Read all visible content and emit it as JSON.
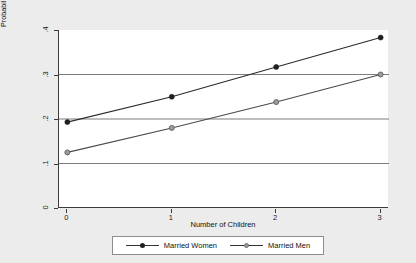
{
  "chart_data": {
    "type": "line",
    "title": "",
    "subtitle": "",
    "xlabel": "Number of Children",
    "ylabel": "Probability of No Articles",
    "x": [
      0,
      1,
      2,
      3
    ],
    "xticklabels": [
      "0",
      "1",
      "2",
      "3"
    ],
    "yticklabels": [
      "0",
      ".1",
      ".2",
      ".3",
      ".4"
    ],
    "yticks": [
      0,
      0.1,
      0.2,
      0.3,
      0.4
    ],
    "xlim": [
      -0.08,
      3.08
    ],
    "ylim": [
      0,
      0.4
    ],
    "grid": "horizontal",
    "gridlines": [
      0.1,
      0.2,
      0.3
    ],
    "legend_position": "bottom",
    "series": [
      {
        "name": "Married Women",
        "marker": "filled-circle",
        "color": "#2b2b2b",
        "values": [
          0.193,
          0.25,
          0.317,
          0.383
        ]
      },
      {
        "name": "Married Men",
        "marker": "open-circle",
        "color": "#4a4a4a",
        "values": [
          0.125,
          0.18,
          0.238,
          0.3
        ]
      }
    ]
  },
  "legend": {
    "entries": [
      {
        "label": "Married Women"
      },
      {
        "label": "Married Men"
      }
    ]
  },
  "colors": {
    "background": "#ececec",
    "plot_background": "#ffffff",
    "axis": "#3b3b3b",
    "gridline": "#6e6e6e",
    "series_women": "#2b2b2b",
    "series_men": "#4a4a4a"
  }
}
